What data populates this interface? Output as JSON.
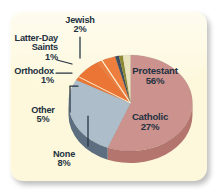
{
  "figure": {
    "panel_bg": "#fdf8dc",
    "canvas_bg": "#ffffff",
    "label_color": "#23313f"
  },
  "chart_data": {
    "type": "pie",
    "title": "",
    "subtitle": "",
    "xlabel": "",
    "ylabel": "",
    "grid": false,
    "legend_position": "none",
    "style": "3d-exploded-none",
    "units": "percent",
    "categories": [
      "Protestant",
      "Catholic",
      "None",
      "Other",
      "Orthodox",
      "Latter-Day Saints",
      "Jewish"
    ],
    "values": [
      56,
      27,
      8,
      5,
      1,
      1,
      2
    ],
    "labels": [
      {
        "name": "Protestant",
        "value": 56,
        "value_text": "56%",
        "color": "#cc938e",
        "side_color": "#b5756f",
        "placement": "inside"
      },
      {
        "name": "Catholic",
        "value": 27,
        "value_text": "27%",
        "color": "#aebdca",
        "side_color": "#5d6e80",
        "placement": "inside"
      },
      {
        "name": "None",
        "value": 8,
        "value_text": "8%",
        "color": "#ea7534",
        "side_color": "#c25520",
        "placement": "outside"
      },
      {
        "name": "Other",
        "value": 5,
        "value_text": "5%",
        "color": "#ee7e3e",
        "side_color": "#c25f24",
        "placement": "outside"
      },
      {
        "name": "Orthodox",
        "value": 1,
        "value_text": "1%",
        "color": "#3f4f63",
        "side_color": "#2b384a",
        "placement": "outside"
      },
      {
        "name": "Latter-Day Saints",
        "value": 1,
        "value_text": "1%",
        "color": "#8d8b36",
        "side_color": "#6d6b24",
        "placement": "outside"
      },
      {
        "name": "Jewish",
        "value": 2,
        "value_text": "2%",
        "color": "#e9e4bd",
        "side_color": "#c7c197",
        "placement": "outside"
      }
    ]
  },
  "labels_text": {
    "jewish_name": "Jewish",
    "jewish_pct": "2%",
    "lds_name_line1": "Latter-Day",
    "lds_name_line2": "Saints",
    "lds_pct": "1%",
    "orthodox_name": "Orthodox",
    "orthodox_pct": "1%",
    "other_name": "Other",
    "other_pct": "5%",
    "none_name": "None",
    "none_pct": "8%",
    "protestant_name": "Protestant",
    "protestant_pct": "56%",
    "catholic_name": "Catholic",
    "catholic_pct": "27%"
  }
}
